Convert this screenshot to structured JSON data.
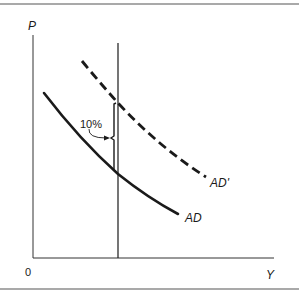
{
  "figure": {
    "axes": {
      "y_label": "P",
      "x_label": "Y",
      "origin_label": "0"
    },
    "curves": [
      {
        "id": "AD",
        "label": "AD",
        "style": "solid"
      },
      {
        "id": "AD_prime",
        "label": "AD'",
        "style": "dashed"
      }
    ],
    "vertical_line": {
      "description": "fixed output level"
    },
    "annotation": {
      "text": "10%",
      "meaning": "vertical shift between AD and AD' at fixed output"
    },
    "colors": {
      "ink": "#1a1a1a",
      "background": "#ffffff",
      "frame": "#555555"
    }
  }
}
